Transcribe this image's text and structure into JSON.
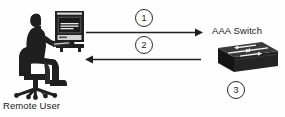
{
  "diagram": {
    "background_color": "#fefefe",
    "ink_color": "#1a1a1a",
    "labels": {
      "remote_user": "Remote User",
      "aaa_switch": "AAA Switch"
    },
    "steps": [
      {
        "number": "1",
        "direction": "right",
        "description": "Remote user sends request to AAA switch"
      },
      {
        "number": "2",
        "direction": "left",
        "description": "AAA switch responds to remote user"
      },
      {
        "number": "3",
        "direction": "none",
        "description": "AAA switch action"
      }
    ],
    "nodes": [
      {
        "name": "remote-user",
        "icon": "person-at-computer-on-chair-icon",
        "label": "Remote User"
      },
      {
        "name": "aaa-switch",
        "icon": "network-switch-icon",
        "label": "AAA Switch"
      }
    ],
    "arrows": [
      {
        "name": "arrow-user-to-switch",
        "from": "remote-user",
        "to": "aaa-switch",
        "step": "1"
      },
      {
        "name": "arrow-switch-to-user",
        "from": "aaa-switch",
        "to": "remote-user",
        "step": "2"
      }
    ]
  }
}
